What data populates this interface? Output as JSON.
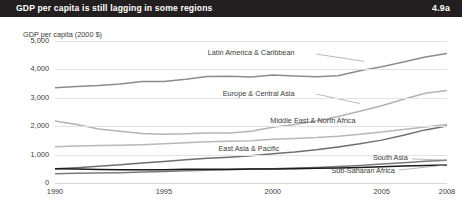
{
  "header": {
    "title": "GDP per capita is still lagging in some regions",
    "number": "4.9a",
    "background": "#231f20",
    "text_color": "#ffffff"
  },
  "chart_data": {
    "type": "line",
    "title": "GDP per capita is still lagging in some regions",
    "subtitle": "",
    "xlabel": "",
    "ylabel": "GDP per capita (2000 $)",
    "axis_title": "GDP per capita (2000 $)",
    "xlim": [
      1990,
      2008
    ],
    "ylim": [
      0,
      5000
    ],
    "xticks": [
      1990,
      1995,
      2000,
      2005,
      2008
    ],
    "xticklabels": [
      "1990",
      "1995",
      "2000",
      "2005",
      "2008"
    ],
    "yticks": [
      0,
      1000,
      2000,
      3000,
      4000,
      5000
    ],
    "yticklabels": [
      "0",
      "1,000",
      "2,000",
      "3,000",
      "4,000",
      "5,000"
    ],
    "grid": true,
    "legend": "inline-labels",
    "x": [
      1990,
      1991,
      1992,
      1993,
      1994,
      1995,
      1996,
      1997,
      1998,
      1999,
      2000,
      2001,
      2002,
      2003,
      2004,
      2005,
      2006,
      2007,
      2008
    ],
    "series": [
      {
        "name": "Latin America & Caribbean",
        "color": "#8c8c8c",
        "width": 1.5,
        "values": [
          3350,
          3400,
          3430,
          3490,
          3570,
          3570,
          3650,
          3750,
          3760,
          3730,
          3800,
          3770,
          3740,
          3780,
          3950,
          4090,
          4260,
          4440,
          4560
        ],
        "label_x": 2001.0,
        "label_y": 4560,
        "label_align": "end"
      },
      {
        "name": "Europe & Central Asia",
        "color": "#b3b3b3",
        "width": 1.5,
        "values": [
          2180,
          2060,
          1900,
          1820,
          1740,
          1720,
          1730,
          1760,
          1760,
          1820,
          1960,
          2060,
          2180,
          2340,
          2530,
          2720,
          2950,
          3160,
          3260
        ],
        "label_x": 2001.0,
        "label_y": 3150,
        "label_align": "end"
      },
      {
        "name": "Middle East & North Africa",
        "color": "#b8b8b8",
        "width": 1.5,
        "values": [
          1280,
          1300,
          1320,
          1330,
          1350,
          1380,
          1420,
          1450,
          1470,
          1490,
          1540,
          1570,
          1600,
          1650,
          1720,
          1800,
          1880,
          1970,
          2060
        ],
        "label_x": 2003.8,
        "label_y": 2190,
        "label_align": "end"
      },
      {
        "name": "East Asia & Pacific",
        "color": "#6e6e6e",
        "width": 1.5,
        "values": [
          500,
          540,
          590,
          640,
          700,
          760,
          820,
          870,
          910,
          960,
          1030,
          1090,
          1170,
          1270,
          1380,
          1510,
          1680,
          1870,
          2010
        ],
        "label_x": 2000.3,
        "label_y": 1180,
        "label_align": "end"
      },
      {
        "name": "South Asia",
        "color": "#7a7a7a",
        "width": 1.5,
        "values": [
          330,
          340,
          350,
          365,
          385,
          405,
          430,
          445,
          465,
          490,
          505,
          525,
          545,
          580,
          620,
          665,
          715,
          770,
          800
        ],
        "label_x": 2006.2,
        "label_y": 880,
        "label_align": "end"
      },
      {
        "name": "Sub-Saharan Africa",
        "color": "#1a1a1a",
        "width": 1.5,
        "values": [
          500,
          490,
          475,
          470,
          465,
          470,
          480,
          485,
          485,
          490,
          495,
          505,
          515,
          530,
          550,
          570,
          595,
          620,
          635
        ],
        "label_x": 2005.6,
        "label_y": 430,
        "label_align": "end"
      }
    ]
  }
}
